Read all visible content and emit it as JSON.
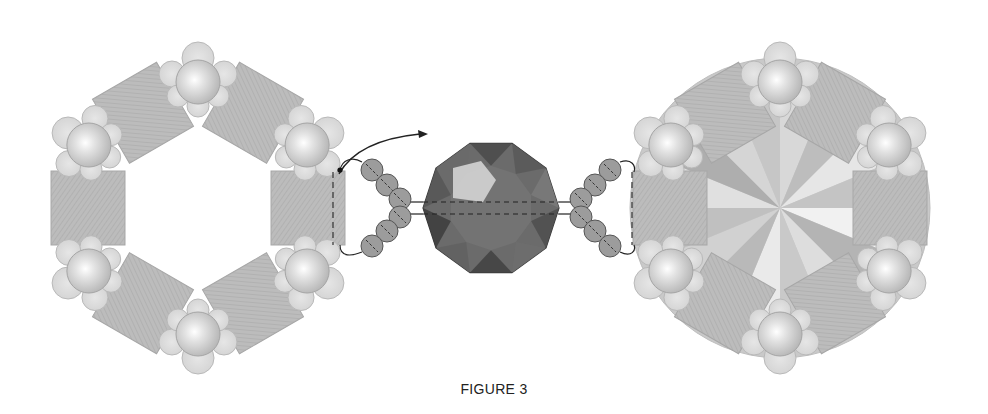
{
  "caption": "FIGURE 3",
  "colors": {
    "square_fill": "#b9b9b9",
    "square_stroke": "#a7a7a7",
    "pearl_petal": "#dcdcdc",
    "pearl_petal_stroke": "#b9b9b9",
    "pearl_core": "#d4d4d4",
    "seed_bead": "#9c9c9c",
    "seed_bead_stroke": "#555555",
    "crystal_dark": "#4a4a4a",
    "crystal_mid": "#6b6b6b",
    "crystal_light": "#cfcfcf",
    "thread": "#222222",
    "rivoli_base": "#c9c9c9"
  },
  "panels": [
    {
      "name": "left-ring",
      "cx": 198,
      "cy": 208,
      "has_rivoli": false
    },
    {
      "name": "right-ring",
      "cx": 780,
      "cy": 208,
      "has_rivoli": true
    }
  ],
  "center_bead": {
    "cx": 491,
    "cy": 208,
    "r": 68,
    "sides": 10
  },
  "seed_chains": [
    {
      "side": "left",
      "count": 6
    },
    {
      "side": "right",
      "count": 6
    }
  ]
}
